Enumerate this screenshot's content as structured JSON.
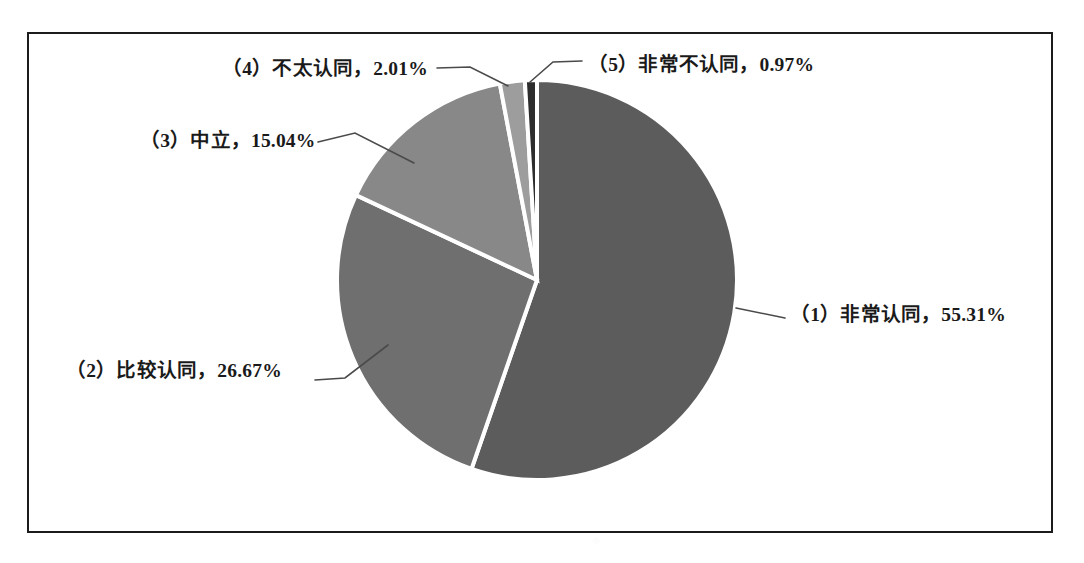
{
  "chart_data": {
    "type": "pie",
    "title": "",
    "xlabel": "",
    "ylabel": "",
    "legend_position": "none",
    "grid": false,
    "label_format": "{category}, {value}%",
    "start_angle_deg": 0,
    "direction": "clockwise",
    "categories": [
      "（1）非常认同",
      "（2）比较认同",
      "（3）中立",
      "（4）不太认同",
      "（5）非常不认同"
    ],
    "values": [
      55.31,
      26.67,
      15.04,
      2.01,
      0.97
    ],
    "colors": [
      "#5c5c5c",
      "#6f6f6f",
      "#888888",
      "#9d9d9d",
      "#2d2d2d"
    ],
    "slice_separator_color": "#ffffff",
    "labels": [
      {
        "id": "1",
        "text": "（1）非常认同，55.31%",
        "category": "（1）非常认同",
        "value": 55.31
      },
      {
        "id": "2",
        "text": "（2）比较认同，26.67%",
        "category": "（2）比较认同",
        "value": 26.67
      },
      {
        "id": "3",
        "text": "（3）中立，15.04%",
        "category": "（3）中立",
        "value": 15.04
      },
      {
        "id": "4",
        "text": "（4）不太认同，2.01%",
        "category": "（4）不太认同",
        "value": 2.01
      },
      {
        "id": "5",
        "text": "（5）非常不认同，0.97%",
        "category": "（5）非常不认同",
        "value": 0.97
      }
    ]
  },
  "frame": {
    "border_color": "#1c1c1c",
    "background_color": "#ffffff"
  },
  "page": {
    "background_color": "#ffffff",
    "leader_line_color": "#4a4a4a"
  }
}
